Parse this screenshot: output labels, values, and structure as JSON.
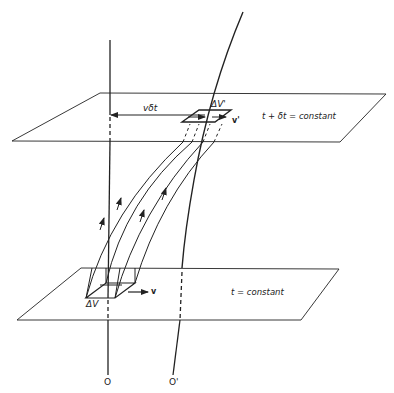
{
  "diagram": {
    "title": "",
    "labels": {
      "upper_plane": "t + δt = constant",
      "lower_plane": "t = constant",
      "displacement": "vδt",
      "volume_upper": "ΔV'",
      "volume_lower": "ΔV",
      "velocity_upper": "v'",
      "velocity_lower": "v",
      "origin": "O",
      "origin_prime": "O'"
    },
    "colors": {
      "stroke": "#222222",
      "background": "#ffffff"
    }
  }
}
